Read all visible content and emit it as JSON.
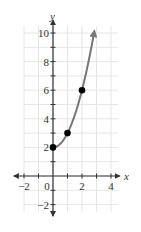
{
  "chart_data": {
    "type": "line",
    "title": "",
    "xlabel": "x",
    "ylabel": "y",
    "xlim": [
      -2.5,
      4.5
    ],
    "ylim": [
      -2.5,
      10.5
    ],
    "grid": true,
    "x_ticks": [
      -2,
      0,
      2,
      4
    ],
    "y_ticks": [
      -2,
      2,
      4,
      6,
      8,
      10
    ],
    "x_tick_labels": [
      "−2",
      "0",
      "2",
      "4"
    ],
    "y_tick_labels": [
      "−2",
      "2",
      "4",
      "6",
      "8",
      "10"
    ],
    "series": [
      {
        "name": "y = x^2 + 2",
        "function": "x^2 + 2",
        "domain": [
          0,
          2.85
        ],
        "color": "#777777",
        "end_arrow": true
      }
    ],
    "points": [
      {
        "x": 0,
        "y": 2
      },
      {
        "x": 1,
        "y": 3
      },
      {
        "x": 2,
        "y": 6
      }
    ],
    "point_color": "#000000",
    "grid_color": "#e6e6e6",
    "axis_color": "#333333"
  }
}
